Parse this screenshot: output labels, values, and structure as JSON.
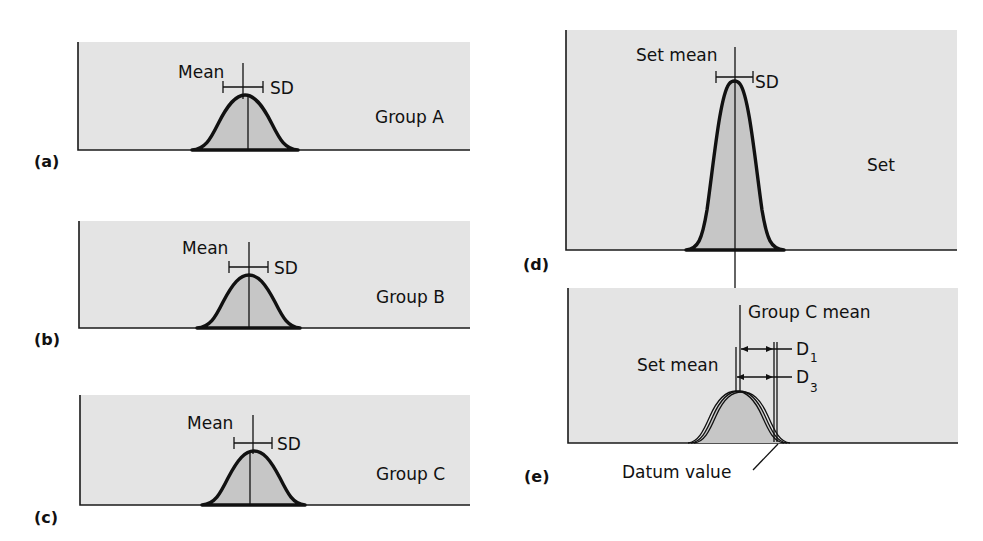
{
  "figure": {
    "panels": [
      {
        "id": "a",
        "label": "(a)",
        "group_label": "Group A",
        "mean_label": "Mean",
        "sd_label": "SD"
      },
      {
        "id": "b",
        "label": "(b)",
        "group_label": "Group B",
        "mean_label": "Mean",
        "sd_label": "SD"
      },
      {
        "id": "c",
        "label": "(c)",
        "group_label": "Group C",
        "mean_label": "Mean",
        "sd_label": "SD"
      },
      {
        "id": "d",
        "label": "(d)",
        "group_label": "Set",
        "mean_label": "Set mean",
        "sd_label": "SD"
      },
      {
        "id": "e",
        "label": "(e)",
        "group_c_mean_label": "Group C mean",
        "set_mean_label": "Set mean",
        "d1_label": "D",
        "d1_sub": "1",
        "d3_label": "D",
        "d3_sub": "3",
        "datum_label": "Datum value"
      }
    ],
    "colors": {
      "panel_background": "#e4e4e4",
      "curve_fill": "#c6c6c6",
      "stroke": "#111111"
    }
  }
}
